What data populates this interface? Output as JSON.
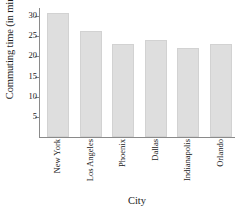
{
  "chart_data": {
    "type": "bar",
    "title": "",
    "xlabel": "City",
    "ylabel": "Commuting time (in minutes)",
    "categories": [
      "New York",
      "Los Angeles",
      "Phoenix",
      "Dallas",
      "Indianapolis",
      "Orlando"
    ],
    "values": [
      30.8,
      26.3,
      23.0,
      24.0,
      22.0,
      23.0
    ],
    "ylim": [
      0,
      32
    ],
    "yticks": [
      5,
      10,
      15,
      20,
      25,
      30
    ],
    "ytick_labels": [
      "5",
      "10",
      "15",
      "20",
      "25",
      "30"
    ],
    "grid": false,
    "legend": null,
    "bar_color": "#dedede",
    "bar_edge_color": "#d2d2d2",
    "axis_color": "#8a8a8a"
  },
  "axes": {
    "y_title": "Commuting time (in minutes)",
    "x_title": "City"
  }
}
